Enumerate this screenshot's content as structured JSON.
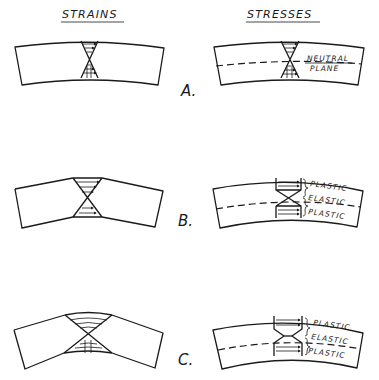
{
  "headers": {
    "strains": "STRAINS",
    "stresses": "STRESSES"
  },
  "rows": [
    {
      "label": "A.",
      "stress_annotations": [
        "NEUTRAL",
        "PLANE"
      ]
    },
    {
      "label": "B.",
      "stress_annotations": [
        "PLASTIC",
        "ELASTIC",
        "PLASTIC"
      ]
    },
    {
      "label": "C.",
      "stress_annotations": [
        "PLASTIC",
        "ELASTIC",
        "PLASTIC"
      ]
    }
  ],
  "colors": {
    "ink": "#1a1a1a",
    "background": "#ffffff"
  }
}
